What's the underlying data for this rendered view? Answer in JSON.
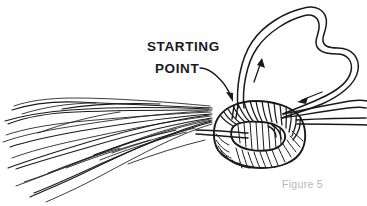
{
  "figure": {
    "title_caption": "Figure 5",
    "caption_color": "#b8b8b8",
    "ink_color": "#1a1a1a",
    "background_color": "#ffffff",
    "width": 367,
    "height": 206
  },
  "annotations": {
    "starting_point": {
      "line1": "STARTING",
      "line2": "POINT",
      "leader_target": "left edge of the coil wrap where the cord first enters the bundle"
    }
  },
  "elements": {
    "fiber_bundle_name": "fiber-bundle",
    "coil_name": "wrapped-coil",
    "loop_name": "cord-loop",
    "arrow_up_name": "direction-arrow-up",
    "arrow_down_name": "direction-arrow-down",
    "leader_arrow_name": "leader-arrow"
  }
}
